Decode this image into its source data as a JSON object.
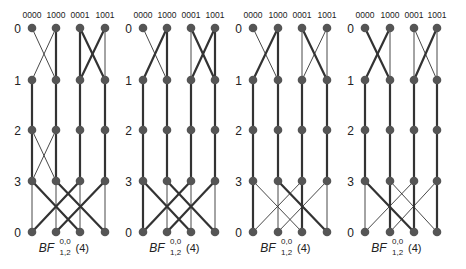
{
  "figure": {
    "panel_count": 4,
    "colors": {
      "node": "#555555",
      "edge": "#333333",
      "text": "#222222"
    },
    "column_labels": [
      "0000",
      "1000",
      "0001",
      "1001"
    ],
    "row_labels": [
      "0",
      "1",
      "2",
      "3",
      "0"
    ],
    "rows_y": [
      28,
      80,
      130,
      181,
      232
    ],
    "panels": [
      {
        "label": {
          "base": "BF",
          "sup": "0,0",
          "sub": "1,2",
          "arg": "(4)"
        },
        "cols_x": [
          32,
          56,
          80,
          105
        ],
        "edges": [
          [
            0,
            0,
            0,
            0,
            1
          ],
          [
            0,
            1,
            1,
            1,
            3
          ],
          [
            0,
            0,
            1,
            1,
            1
          ],
          [
            0,
            1,
            1,
            0,
            1
          ],
          [
            0,
            2,
            1,
            2,
            3
          ],
          [
            0,
            3,
            1,
            3,
            1
          ],
          [
            0,
            2,
            1,
            3,
            3
          ],
          [
            0,
            3,
            1,
            2,
            3
          ],
          [
            1,
            0,
            2,
            0,
            3
          ],
          [
            1,
            1,
            2,
            1,
            3
          ],
          [
            1,
            2,
            2,
            2,
            3
          ],
          [
            1,
            3,
            2,
            3,
            3
          ],
          [
            2,
            0,
            3,
            0,
            3
          ],
          [
            2,
            1,
            3,
            1,
            3
          ],
          [
            2,
            0,
            3,
            1,
            1
          ],
          [
            2,
            1,
            3,
            0,
            1
          ],
          [
            2,
            2,
            3,
            2,
            3
          ],
          [
            2,
            3,
            3,
            3,
            3
          ],
          [
            3,
            0,
            4,
            0,
            1
          ],
          [
            3,
            1,
            4,
            1,
            1
          ],
          [
            3,
            2,
            4,
            2,
            1
          ],
          [
            3,
            3,
            4,
            3,
            1
          ],
          [
            3,
            0,
            4,
            2,
            3
          ],
          [
            3,
            2,
            4,
            0,
            3
          ],
          [
            3,
            1,
            4,
            3,
            3
          ],
          [
            3,
            3,
            4,
            1,
            3
          ]
        ]
      },
      {
        "label": {
          "base": "BF",
          "sup": "0,0",
          "sub": "1,2",
          "arg": "(4)"
        },
        "cols_x": [
          143,
          167,
          191,
          215
        ],
        "edges": [
          [
            0,
            0,
            0,
            0,
            1
          ],
          [
            0,
            1,
            1,
            1,
            3
          ],
          [
            0,
            0,
            1,
            1,
            1
          ],
          [
            0,
            1,
            1,
            0,
            3
          ],
          [
            0,
            2,
            1,
            2,
            1
          ],
          [
            0,
            3,
            1,
            3,
            3
          ],
          [
            0,
            2,
            1,
            3,
            3
          ],
          [
            0,
            3,
            1,
            2,
            3
          ],
          [
            1,
            0,
            2,
            0,
            3
          ],
          [
            1,
            1,
            2,
            1,
            3
          ],
          [
            1,
            2,
            2,
            2,
            3
          ],
          [
            1,
            3,
            2,
            3,
            3
          ],
          [
            2,
            0,
            3,
            0,
            3
          ],
          [
            2,
            1,
            3,
            1,
            3
          ],
          [
            2,
            2,
            3,
            2,
            3
          ],
          [
            2,
            3,
            3,
            3,
            3
          ],
          [
            3,
            0,
            4,
            0,
            3
          ],
          [
            3,
            1,
            4,
            1,
            1
          ],
          [
            3,
            2,
            4,
            2,
            1
          ],
          [
            3,
            3,
            4,
            3,
            1
          ],
          [
            3,
            0,
            4,
            2,
            3
          ],
          [
            3,
            2,
            4,
            0,
            3
          ],
          [
            3,
            1,
            4,
            3,
            3
          ],
          [
            3,
            3,
            4,
            1,
            3
          ]
        ]
      },
      {
        "label": {
          "base": "BF",
          "sup": "0,0",
          "sub": "1,2",
          "arg": "(4)"
        },
        "cols_x": [
          253,
          278,
          302,
          327
        ],
        "edges": [
          [
            0,
            0,
            0,
            0,
            1
          ],
          [
            0,
            1,
            1,
            1,
            3
          ],
          [
            0,
            0,
            1,
            1,
            1
          ],
          [
            0,
            1,
            1,
            0,
            3
          ],
          [
            0,
            2,
            1,
            2,
            1
          ],
          [
            0,
            3,
            1,
            3,
            1
          ],
          [
            0,
            2,
            1,
            3,
            3
          ],
          [
            0,
            3,
            1,
            2,
            1
          ],
          [
            1,
            0,
            2,
            0,
            3
          ],
          [
            1,
            1,
            2,
            1,
            3
          ],
          [
            1,
            2,
            2,
            2,
            3
          ],
          [
            1,
            3,
            2,
            3,
            3
          ],
          [
            2,
            0,
            3,
            0,
            3
          ],
          [
            2,
            1,
            3,
            1,
            3
          ],
          [
            2,
            2,
            3,
            2,
            3
          ],
          [
            2,
            3,
            3,
            3,
            3
          ],
          [
            3,
            0,
            4,
            0,
            3
          ],
          [
            3,
            1,
            4,
            1,
            1
          ],
          [
            3,
            2,
            4,
            2,
            3
          ],
          [
            3,
            3,
            4,
            3,
            1
          ],
          [
            3,
            0,
            4,
            2,
            1
          ],
          [
            3,
            2,
            4,
            0,
            1
          ],
          [
            3,
            1,
            4,
            3,
            3
          ],
          [
            3,
            3,
            4,
            1,
            1
          ]
        ]
      },
      {
        "label": {
          "base": "BF",
          "sup": "0,0",
          "sub": "1,2",
          "arg": "(4)"
        },
        "cols_x": [
          365,
          390,
          414,
          437
        ],
        "edges": [
          [
            0,
            0,
            0,
            0,
            1
          ],
          [
            0,
            1,
            1,
            1,
            1
          ],
          [
            0,
            0,
            1,
            1,
            3
          ],
          [
            0,
            1,
            1,
            0,
            3
          ],
          [
            0,
            2,
            1,
            2,
            1
          ],
          [
            0,
            3,
            1,
            3,
            1
          ],
          [
            0,
            2,
            1,
            3,
            1
          ],
          [
            0,
            3,
            1,
            2,
            3
          ],
          [
            1,
            0,
            2,
            0,
            3
          ],
          [
            1,
            1,
            2,
            1,
            3
          ],
          [
            1,
            2,
            2,
            2,
            3
          ],
          [
            1,
            3,
            2,
            3,
            3
          ],
          [
            2,
            0,
            3,
            0,
            3
          ],
          [
            2,
            1,
            3,
            1,
            3
          ],
          [
            2,
            2,
            3,
            2,
            3
          ],
          [
            2,
            3,
            3,
            3,
            3
          ],
          [
            3,
            0,
            4,
            0,
            1
          ],
          [
            3,
            1,
            4,
            1,
            3
          ],
          [
            3,
            2,
            4,
            2,
            3
          ],
          [
            3,
            3,
            4,
            3,
            3
          ],
          [
            3,
            0,
            4,
            2,
            3
          ],
          [
            3,
            2,
            4,
            0,
            1
          ],
          [
            3,
            1,
            4,
            3,
            1
          ],
          [
            3,
            3,
            4,
            1,
            1
          ]
        ]
      }
    ]
  }
}
